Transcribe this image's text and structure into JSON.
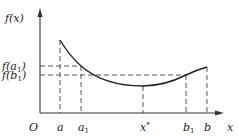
{
  "diagram": {
    "type": "function-graph",
    "y_axis_label": "f(x)",
    "x_axis_label": "x",
    "origin_label": "O",
    "y_ticks": [
      {
        "id": "fa1",
        "label_main": "f(a",
        "label_sub": "1",
        "label_close": ")",
        "y": 66
      },
      {
        "id": "fb1",
        "label_main": "f(b",
        "label_sub": "1",
        "label_close": ")",
        "y": 75
      }
    ],
    "x_ticks": [
      {
        "id": "a",
        "label_main": "a",
        "label_sub": "",
        "x": 60
      },
      {
        "id": "a1",
        "label_main": "a",
        "label_sub": "1",
        "x": 81
      },
      {
        "id": "xstar",
        "label_main": "x",
        "label_sub": "*",
        "x": 143
      },
      {
        "id": "b1",
        "label_main": "b",
        "label_sub": "1",
        "x": 186
      },
      {
        "id": "b",
        "label_main": "b",
        "label_sub": "",
        "x": 207
      }
    ],
    "curve_points": [
      {
        "label": "a",
        "x": 60,
        "y": 40
      },
      {
        "label": "a1",
        "x": 81,
        "y": 66
      },
      {
        "label": "x*",
        "x": 143,
        "y": 86
      },
      {
        "label": "b1",
        "x": 186,
        "y": 75
      },
      {
        "label": "b",
        "x": 207,
        "y": 67
      }
    ],
    "colors": {
      "axis": "#333333",
      "curve": "#222222",
      "dashed": "#555555"
    }
  }
}
